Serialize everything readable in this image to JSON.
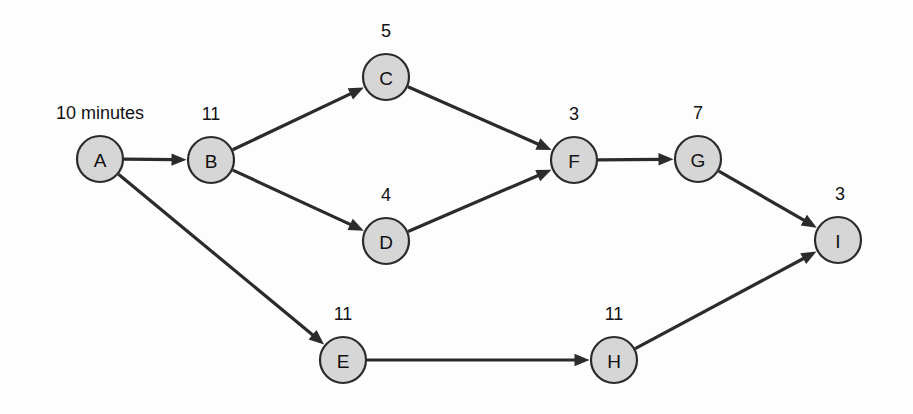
{
  "diagram": {
    "type": "activity-network-diagram",
    "background_color": "#fdfdfd",
    "node_fill_color": "#d6d6d6",
    "node_stroke_color": "#2b2b2b",
    "edge_color": "#2b2b2b",
    "nodes": [
      {
        "id": "A",
        "label": "A",
        "duration": "10 minutes",
        "cx": 100,
        "cy": 159,
        "r": 23,
        "duration_x": 100,
        "duration_y": 119
      },
      {
        "id": "B",
        "label": "B",
        "duration": "11",
        "cx": 211,
        "cy": 160,
        "r": 23,
        "duration_x": 211,
        "duration_y": 120
      },
      {
        "id": "C",
        "label": "C",
        "duration": "5",
        "cx": 386,
        "cy": 77,
        "r": 23,
        "duration_x": 386,
        "duration_y": 37
      },
      {
        "id": "D",
        "label": "D",
        "duration": "4",
        "cx": 386,
        "cy": 241,
        "r": 23,
        "duration_x": 386,
        "duration_y": 201
      },
      {
        "id": "E",
        "label": "E",
        "duration": "11",
        "cx": 343,
        "cy": 360,
        "r": 23,
        "duration_x": 343,
        "duration_y": 320
      },
      {
        "id": "F",
        "label": "F",
        "duration": "3",
        "cx": 574,
        "cy": 160,
        "r": 23,
        "duration_x": 574,
        "duration_y": 120
      },
      {
        "id": "G",
        "label": "G",
        "duration": "7",
        "cx": 698,
        "cy": 159,
        "r": 23,
        "duration_x": 698,
        "duration_y": 119
      },
      {
        "id": "H",
        "label": "H",
        "duration": "11",
        "cx": 614,
        "cy": 360,
        "r": 23,
        "duration_x": 614,
        "duration_y": 320
      },
      {
        "id": "I",
        "label": "I",
        "duration": "3",
        "cx": 838,
        "cy": 240,
        "r": 23,
        "duration_x": 840,
        "duration_y": 200
      }
    ],
    "edges": [
      {
        "from": "A",
        "to": "B"
      },
      {
        "from": "A",
        "to": "E"
      },
      {
        "from": "B",
        "to": "C"
      },
      {
        "from": "B",
        "to": "D"
      },
      {
        "from": "C",
        "to": "F"
      },
      {
        "from": "D",
        "to": "F"
      },
      {
        "from": "E",
        "to": "H"
      },
      {
        "from": "F",
        "to": "G"
      },
      {
        "from": "G",
        "to": "I"
      },
      {
        "from": "H",
        "to": "I"
      }
    ]
  }
}
